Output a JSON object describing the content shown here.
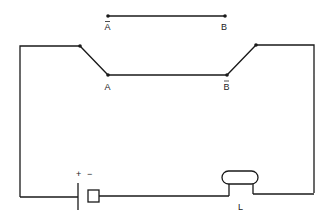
{
  "diagram": {
    "type": "circuit",
    "colors": {
      "wire": "#1a1a1a",
      "background": "#ffffff"
    },
    "labels": {
      "top_left": "A",
      "top_left_bar": true,
      "top_right": "B",
      "switch_left": "A",
      "switch_right": "B",
      "switch_right_bar": true,
      "battery_plus": "+",
      "battery_minus": "−",
      "lamp": "L"
    },
    "components": [
      {
        "name": "reference-wire",
        "from": "A̅",
        "to": "B"
      },
      {
        "name": "switch-left",
        "terminal": "A"
      },
      {
        "name": "switch-right",
        "terminal": "B̅"
      },
      {
        "name": "battery",
        "polarity": [
          "+",
          "−"
        ]
      },
      {
        "name": "lamp",
        "label": "L"
      }
    ]
  }
}
